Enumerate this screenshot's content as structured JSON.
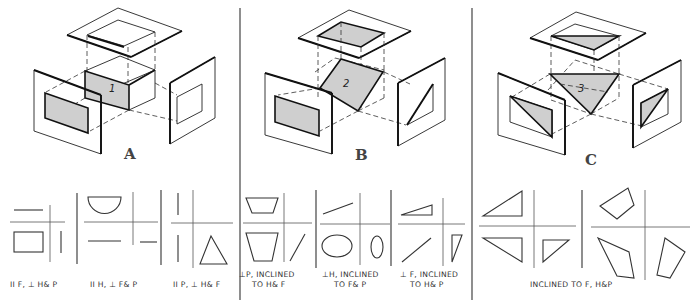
{
  "figures": [
    {
      "letter": "A",
      "surface_number": "1",
      "description": "Surface parallel to frontal plane"
    },
    {
      "letter": "B",
      "surface_number": "2",
      "description": "Surface inclined, perpendicular to profile plane"
    },
    {
      "letter": "C",
      "surface_number": "3",
      "description": "Oblique triangular surface"
    }
  ],
  "captions": {
    "a1": "II F, ⊥ H& P",
    "a2": "II H, ⊥ F& P",
    "a3": "II P, ⊥ H& F",
    "b1_line1": "⊥P, INCLINED",
    "b1_line2": "TO H& F",
    "b2_line1": "⊥H, INCLINED",
    "b2_line2": "TO F& P",
    "b3_line1": "⊥ F, INCLINED",
    "b3_line2": "TO H& P",
    "c": "INCLINED TO F, H&P"
  },
  "colors": {
    "shade": "#cfcfcf",
    "line": "#111111",
    "background": "#ffffff"
  }
}
